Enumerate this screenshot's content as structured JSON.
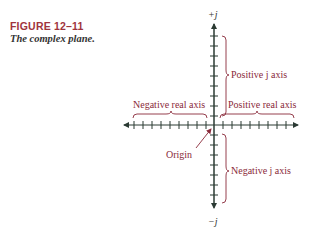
{
  "figure": {
    "number": "FIGURE 12–11",
    "caption": "The complex plane."
  },
  "diagram": {
    "type": "complex-plane",
    "axes": {
      "vertical_top_label": "+j",
      "vertical_bottom_label": "−j",
      "ticks_per_half_axis": 9
    },
    "labels": {
      "positive_j_axis": "Positive j axis",
      "negative_j_axis": "Negative j axis",
      "positive_real_axis": "Positive real axis",
      "negative_real_axis": "Negative real axis",
      "origin": "Origin"
    },
    "colors": {
      "axis": "#2b3a33",
      "annotation": "#8a2a3a",
      "figure_number": "#a0343c"
    }
  }
}
